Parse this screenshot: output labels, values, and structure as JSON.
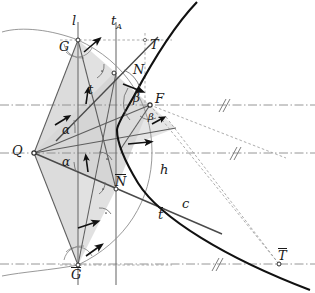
{
  "figure": {
    "kind": "geometric-construction",
    "background": "#ffffff",
    "colors": {
      "curve": "#111111",
      "thin_line": "#7a7a7a",
      "construction": "#9a9a9a",
      "dashed": "#9a9a9a",
      "dashdot": "#8a8a8a",
      "fill": "#dedede",
      "fill_dark": "#cfcfcf",
      "label": "#1a1a1a",
      "arrow": "#111111"
    }
  },
  "labels": [
    {
      "id": "l",
      "text": "l",
      "x": 72,
      "y": 14,
      "size": "sz-lg",
      "bar": false,
      "sub": ""
    },
    {
      "id": "tA",
      "text": "t",
      "x": 111,
      "y": 14,
      "size": "sz-lg",
      "bar": false,
      "sub": "A"
    },
    {
      "id": "G",
      "text": "G",
      "x": 59,
      "y": 40,
      "size": "sz-lg",
      "bar": false,
      "sub": ""
    },
    {
      "id": "T",
      "text": "T",
      "x": 150,
      "y": 38,
      "size": "sz-lg",
      "bar": false,
      "sub": ""
    },
    {
      "id": "N",
      "text": "N",
      "x": 133,
      "y": 63,
      "size": "sz-lg",
      "bar": false,
      "sub": ""
    },
    {
      "id": "F",
      "text": "F",
      "x": 155,
      "y": 92,
      "size": "sz-lg",
      "bar": false,
      "sub": ""
    },
    {
      "id": "beta1",
      "text": "β",
      "x": 133,
      "y": 92,
      "size": "sz-md",
      "bar": false,
      "sub": ""
    },
    {
      "id": "beta2",
      "text": "β",
      "x": 148,
      "y": 112,
      "size": "sz-sm",
      "bar": false,
      "sub": ""
    },
    {
      "id": "t",
      "text": "t",
      "x": 88,
      "y": 83,
      "size": "sz-lg",
      "bar": false,
      "sub": ""
    },
    {
      "id": "Q",
      "text": "Q",
      "x": 12,
      "y": 144,
      "size": "sz-lg",
      "bar": false,
      "sub": ""
    },
    {
      "id": "alpha1",
      "text": "α",
      "x": 62,
      "y": 124,
      "size": "sz-md",
      "bar": false,
      "sub": ""
    },
    {
      "id": "alpha2",
      "text": "α",
      "x": 62,
      "y": 156,
      "size": "sz-md",
      "bar": false,
      "sub": ""
    },
    {
      "id": "Nbar",
      "text": "N",
      "x": 115,
      "y": 175,
      "size": "sz-lg",
      "bar": true,
      "sub": ""
    },
    {
      "id": "h",
      "text": "h",
      "x": 160,
      "y": 163,
      "size": "sz-lg",
      "bar": false,
      "sub": ""
    },
    {
      "id": "c",
      "text": "c",
      "x": 182,
      "y": 197,
      "size": "sz-lg",
      "bar": false,
      "sub": ""
    },
    {
      "id": "tbar",
      "text": "t",
      "x": 158,
      "y": 208,
      "size": "sz-lg",
      "bar": true,
      "sub": ""
    },
    {
      "id": "Gbar",
      "text": "G",
      "x": 71,
      "y": 268,
      "size": "sz-lg",
      "bar": true,
      "sub": ""
    },
    {
      "id": "Tbar",
      "text": "T",
      "x": 278,
      "y": 249,
      "size": "sz-lg",
      "bar": true,
      "sub": ""
    }
  ],
  "points": [
    {
      "id": "G",
      "x": 78,
      "y": 40,
      "name": "point-G"
    },
    {
      "id": "N",
      "x": 114,
      "y": 73,
      "name": "point-N"
    },
    {
      "id": "F",
      "x": 150,
      "y": 105,
      "name": "point-F"
    },
    {
      "id": "Q",
      "x": 34,
      "y": 153,
      "name": "point-Q"
    },
    {
      "id": "Nbar",
      "x": 116,
      "y": 189,
      "name": "point-N-bar"
    },
    {
      "id": "Gbar",
      "x": 78,
      "y": 265,
      "name": "point-G-bar"
    },
    {
      "id": "Tbar",
      "x": 279,
      "y": 264,
      "name": "point-T-bar"
    },
    {
      "id": "T",
      "x": 145,
      "y": 44,
      "name": "point-T"
    }
  ],
  "vertical_lines": [
    {
      "id": "l",
      "x": 78,
      "y1": 22,
      "y2": 283,
      "name": "vertical-line-l"
    },
    {
      "id": "tA",
      "x": 116,
      "y1": 22,
      "y2": 283,
      "name": "vertical-line-tA"
    }
  ],
  "horizontal_axes": [
    {
      "id": "axis-F",
      "y": 105,
      "x1": 0,
      "x2": 315,
      "style": "dashdot",
      "tick_x": 222
    },
    {
      "id": "axis-Q",
      "y": 153,
      "x1": 0,
      "x2": 315,
      "style": "dashdot",
      "tick_x": 233
    },
    {
      "id": "axis-Tbar",
      "y": 264,
      "x1": 0,
      "x2": 315,
      "style": "dashdot",
      "tick_x": 215
    }
  ],
  "dashed_guides": [
    {
      "id": "guide-G",
      "x1": 78,
      "y1": 40,
      "x2": 170,
      "y2": 40
    },
    {
      "id": "guide-Gbar",
      "x1": 78,
      "y1": 265,
      "x2": 170,
      "y2": 265
    },
    {
      "id": "guide-T",
      "x1": 145,
      "y1": 33,
      "x2": 145,
      "y2": 105
    }
  ],
  "angle_marks": {
    "right_angle_dot": "·",
    "count": 4
  },
  "curve": {
    "name": "conic-branch-c",
    "type": "hyperbola-branch",
    "vertex": {
      "x": 117,
      "y": 126
    },
    "passes_through": [
      "N",
      "N-bar",
      "T-bar"
    ]
  }
}
